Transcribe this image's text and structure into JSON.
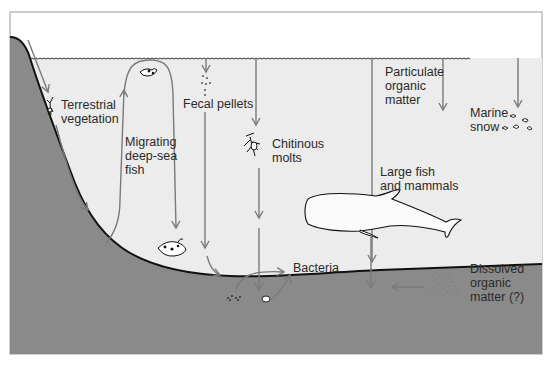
{
  "colors": {
    "water": "#ececec",
    "seabed": "#8a8a8a",
    "arrow": "#7a7a7a",
    "outline": "#111111",
    "text": "#2a2a2a",
    "frame": "#9a9a9a"
  },
  "labels": {
    "terrestrial": "Terrestrial\nvegetation",
    "migrating": "Migrating\ndeep-sea\nfish",
    "fecal": "Fecal pellets",
    "chitinous": "Chitinous\nmolts",
    "particulate": "Particulate\norganic\nmatter",
    "marine_snow": "Marine\nsnow",
    "large_fish": "Large fish\nand mammals",
    "bacteria": "Bacteria",
    "dissolved": "Dissolved\norganic\nmatter (?)"
  },
  "icons": [
    "plant-debris-icon",
    "surface-fish-icon",
    "deep-sea-fish-icon",
    "molt-icon",
    "marine-snow-flakes-icon",
    "whale-icon",
    "dissolved-particles-icon",
    "sediment-pellets-icon"
  ]
}
